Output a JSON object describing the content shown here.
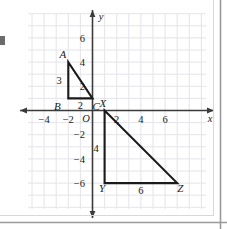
{
  "chart_data": {
    "type": "scatter",
    "title": "",
    "xlabel": "x",
    "ylabel": "y",
    "xlim": [
      -5,
      8
    ],
    "ylim": [
      -7,
      7
    ],
    "grid": true,
    "legend": "none",
    "x_ticks": [
      -4,
      -2,
      2,
      4,
      6
    ],
    "x_tick_labels": [
      "−4",
      "−2",
      "2",
      "4",
      "6"
    ],
    "y_ticks": [
      6,
      4,
      2,
      -2,
      -4,
      -6
    ],
    "y_tick_labels": [
      "6",
      "4",
      "2",
      "−2",
      "−4",
      "−6"
    ],
    "origin_label": "O",
    "axis_arrow_labels": {
      "x": "x",
      "y": "y"
    },
    "shapes": [
      {
        "name": "triangle-abc",
        "type": "polygon",
        "vertices": [
          {
            "label": "A",
            "x": -2,
            "y": 4
          },
          {
            "label": "B",
            "x": -2,
            "y": 1
          },
          {
            "label": "C",
            "x": 0,
            "y": 1
          }
        ],
        "side_labels": [
          {
            "text": "3",
            "side": "AB",
            "x": -2.75,
            "y": 2.5
          },
          {
            "text": "2",
            "side": "BC",
            "x": -1.0,
            "y": 0.45
          }
        ]
      },
      {
        "name": "triangle-xyz",
        "type": "polygon",
        "vertices": [
          {
            "label": "X",
            "x": 1,
            "y": 0
          },
          {
            "label": "Y",
            "x": 1,
            "y": -6
          },
          {
            "label": "Z",
            "x": 7,
            "y": -6
          }
        ],
        "side_labels": [
          {
            "text": "4",
            "side": "XY",
            "x": 0.3,
            "y": -3.1
          },
          {
            "text": "6",
            "side": "YZ",
            "x": 4.0,
            "y": -6.6
          }
        ]
      }
    ],
    "vertex_labels": [
      {
        "text": "A",
        "x": -2.45,
        "y": 4.65
      },
      {
        "text": "B",
        "x": -2.9,
        "y": 0.35
      },
      {
        "text": "C",
        "x": 0.3,
        "y": 0.35
      },
      {
        "text": "X",
        "x": 0.85,
        "y": 0.62
      },
      {
        "text": "Y",
        "x": 0.78,
        "y": -6.45
      },
      {
        "text": "Z",
        "x": 7.25,
        "y": -6.45
      }
    ],
    "colors": {
      "grid": "#e4e4ea",
      "axis": "#3b3b3b",
      "shape_stroke": "#1a1a1a",
      "text": "#1a1a1a",
      "frame": "#9a9a9a",
      "background": "#ffffff"
    }
  }
}
